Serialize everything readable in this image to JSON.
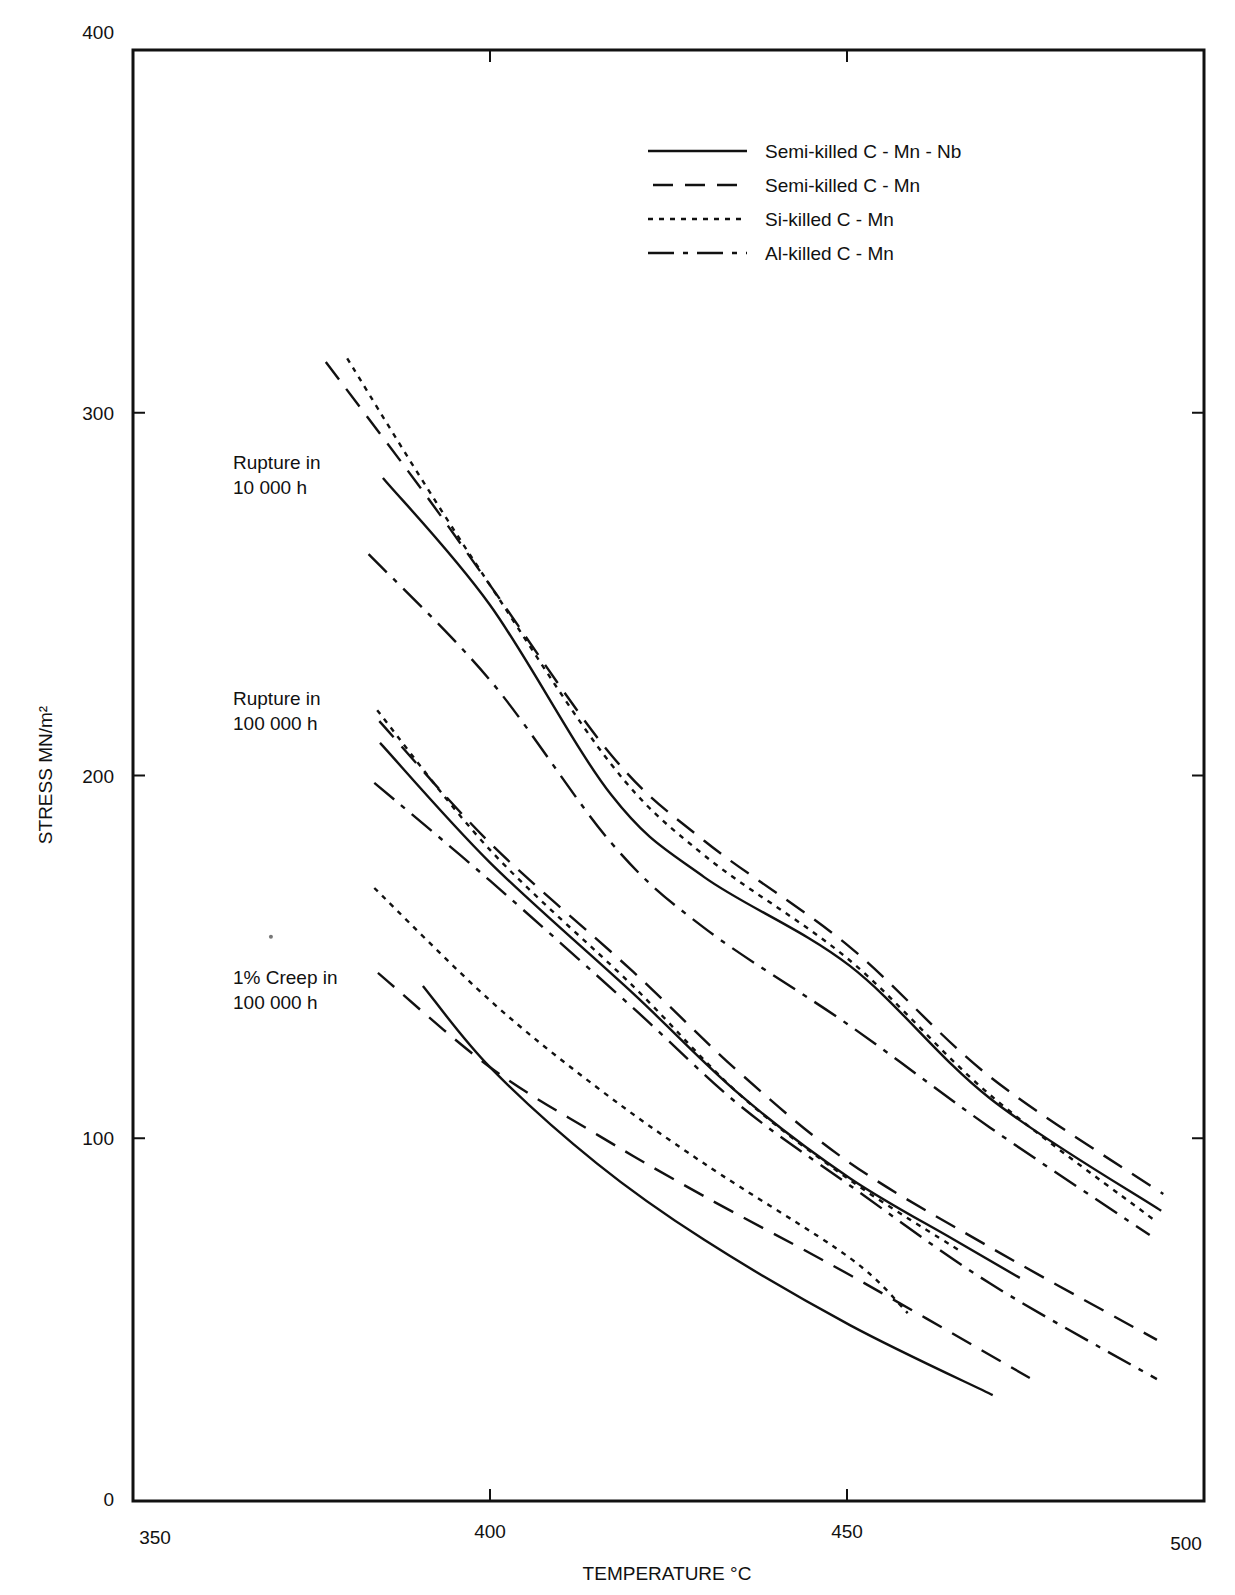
{
  "chart_data": {
    "type": "line",
    "title": "",
    "xlabel": "TEMPERATURE °C",
    "ylabel": "STRESS MN/m²",
    "xlim": [
      350,
      500
    ],
    "ylim": [
      0,
      400
    ],
    "x_ticks": [
      350,
      400,
      450,
      500
    ],
    "y_ticks": [
      0,
      100,
      200,
      300,
      400
    ],
    "grid": false,
    "legend_position": "upper right",
    "legend": [
      {
        "label": "Semi-killed C - Mn - Nb",
        "style": "solid"
      },
      {
        "label": "Semi-killed C - Mn",
        "style": "dashed"
      },
      {
        "label": "Si-killed C - Mn",
        "style": "dotted"
      },
      {
        "label": "Al-killed C - Mn",
        "style": "dashdot"
      }
    ],
    "annotations": [
      {
        "text": [
          "Rupture in",
          "10 000 h"
        ],
        "x": 364,
        "y": 284
      },
      {
        "text": [
          "Rupture in",
          "100 000 h"
        ],
        "x": 364,
        "y": 219
      },
      {
        "text": [
          "1% Creep in",
          "100 000 h"
        ],
        "x": 364,
        "y": 142
      }
    ],
    "series": [
      {
        "group": "Rupture in 10 000 h",
        "name": "Semi-killed C - Mn - Nb",
        "style": "solid",
        "x": [
          385,
          400,
          417,
          430,
          450.4,
          470,
          494
        ],
        "y": [
          282,
          247,
          194.6,
          172,
          147.5,
          111,
          80
        ]
      },
      {
        "group": "Rupture in 10 000 h",
        "name": "Semi-killed C - Mn",
        "style": "dashed",
        "x": [
          377,
          390,
          400,
          417,
          430,
          450.4,
          470,
          494.3
        ],
        "y": [
          314,
          280,
          252.5,
          205.6,
          182,
          152.7,
          117,
          84.6
        ]
      },
      {
        "group": "Rupture in 10 000 h",
        "name": "Si-killed C - Mn",
        "style": "dotted",
        "x": [
          380,
          390,
          400,
          417,
          430,
          450.4,
          470,
          493
        ],
        "y": [
          315,
          283,
          252.5,
          203,
          178,
          149,
          112,
          77.5
        ]
      },
      {
        "group": "Rupture in 10 000 h",
        "name": "Al-killed C - Mn",
        "style": "dashdot",
        "x": [
          383,
          400,
          417,
          430,
          450.4,
          470,
          492.4
        ],
        "y": [
          261,
          226.3,
          181.4,
          158,
          131,
          103,
          73.3
        ]
      },
      {
        "group": "Rupture in 100 000 h",
        "name": "Semi-killed C - Mn - Nb",
        "style": "solid",
        "x": [
          384.6,
          400,
          420,
          435,
          450.4,
          465,
          474.2
        ],
        "y": [
          209,
          176,
          140,
          112,
          89,
          72,
          61.5
        ]
      },
      {
        "group": "Rupture in 100 000 h",
        "name": "Semi-killed C - Mn",
        "style": "dashed",
        "x": [
          384.5,
          400,
          420,
          435,
          450.4,
          470,
          493.4
        ],
        "y": [
          215,
          181.4,
          146,
          118,
          93.2,
          70,
          44.4
        ]
      },
      {
        "group": "Rupture in 100 000 h",
        "name": "Si-killed C - Mn",
        "style": "dotted",
        "x": [
          384.2,
          400,
          420,
          435,
          450.4,
          465.8
        ],
        "y": [
          218,
          179.5,
          142,
          112,
          88.5,
          69
        ]
      },
      {
        "group": "Rupture in 100 000 h",
        "name": "Al-killed C - Mn",
        "style": "dashdot",
        "x": [
          383.8,
          400,
          420,
          435,
          450.4,
          470,
          493.4
        ],
        "y": [
          198,
          171,
          136,
          109,
          87,
          60,
          33.6
        ]
      },
      {
        "group": "1% Creep in 100 000 h",
        "name": "Semi-killed C - Mn - Nb",
        "style": "solid",
        "x": [
          390.6,
          400,
          415,
          430,
          450.4,
          470.4
        ],
        "y": [
          142,
          119.6,
          93,
          72,
          48.5,
          29.2
        ]
      },
      {
        "group": "1% Creep in 100 000 h",
        "name": "Semi-killed C - Mn",
        "style": "dashed",
        "x": [
          384.3,
          400,
          415,
          430,
          450.4,
          475.6
        ],
        "y": [
          145.6,
          119.6,
          101,
          84,
          62.3,
          33.9
        ]
      },
      {
        "group": "1% Creep in 100 000 h",
        "name": "Si-killed C - Mn",
        "style": "dotted",
        "x": [
          383.8,
          400,
          415,
          430,
          450.4,
          458.5
        ],
        "y": [
          169,
          138,
          114,
          93,
          67,
          51.8
        ]
      }
    ]
  },
  "stray_marks": [
    {
      "x": 378,
      "y": 155
    }
  ]
}
